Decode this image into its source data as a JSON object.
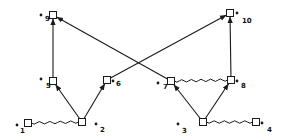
{
  "diagram": {
    "type": "directed-graph",
    "colors": {
      "stroke": "#1a1a1a",
      "background": "#ffffff"
    },
    "nodes": [
      {
        "id": "1",
        "label": "1",
        "x": 28,
        "y": 123,
        "dot": [
          17,
          125
        ],
        "lx": 20,
        "ly": 128
      },
      {
        "id": "2",
        "label": "2",
        "x": 82,
        "y": 122,
        "dot": [
          96,
          124
        ],
        "lx": 100,
        "ly": 127
      },
      {
        "id": "3",
        "label": "3",
        "x": 203,
        "y": 122,
        "dot": [
          178,
          124
        ],
        "lx": 182,
        "ly": 128
      },
      {
        "id": "4",
        "label": "4",
        "x": 256,
        "y": 122,
        "dot": [
          262,
          123
        ],
        "lx": 267,
        "ly": 127
      },
      {
        "id": "5",
        "label": "5",
        "x": 53,
        "y": 81,
        "dot": [
          41,
          79
        ],
        "lx": 46,
        "ly": 83
      },
      {
        "id": "6",
        "label": "6",
        "x": 107,
        "y": 80,
        "dot": [
          113,
          81
        ],
        "lx": 116,
        "ly": 81
      },
      {
        "id": "7",
        "label": "7",
        "x": 171,
        "y": 81,
        "dot": [
          158,
          83
        ],
        "lx": 163,
        "ly": 84
      },
      {
        "id": "8",
        "label": "8",
        "x": 231,
        "y": 80,
        "dot": [
          237,
          81
        ],
        "lx": 241,
        "ly": 83
      },
      {
        "id": "9",
        "label": "9",
        "x": 53,
        "y": 15,
        "dot": [
          41,
          15
        ],
        "lx": 45,
        "ly": 16
      },
      {
        "id": "10",
        "label": "10",
        "x": 230,
        "y": 13,
        "dot": [
          237,
          13
        ],
        "lx": 242,
        "ly": 18
      }
    ],
    "edges": [
      {
        "from": "2",
        "to": "5",
        "style": "arrow"
      },
      {
        "from": "2",
        "to": "6",
        "style": "arrow"
      },
      {
        "from": "5",
        "to": "9",
        "style": "arrow"
      },
      {
        "from": "7",
        "to": "9",
        "style": "arrow"
      },
      {
        "from": "6",
        "to": "10",
        "style": "arrow"
      },
      {
        "from": "8",
        "to": "10",
        "style": "arrow"
      },
      {
        "from": "3",
        "to": "7",
        "style": "arrow"
      },
      {
        "from": "3",
        "to": "8",
        "style": "arrow"
      },
      {
        "from": "1",
        "to": "2",
        "style": "wavy"
      },
      {
        "from": "7",
        "to": "8",
        "style": "wavy"
      },
      {
        "from": "3",
        "to": "4",
        "style": "wavy"
      }
    ]
  }
}
